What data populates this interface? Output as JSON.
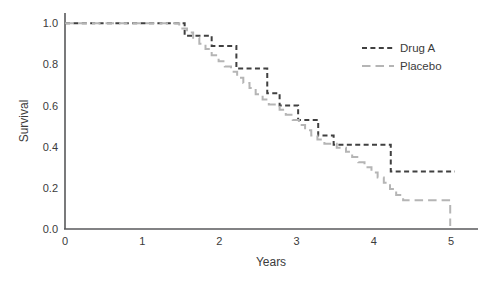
{
  "chart_data": {
    "type": "line",
    "subtype": "kaplan-meier-step",
    "title": "",
    "xlabel": "Years",
    "ylabel": "Survival",
    "xlim": [
      0,
      5.35
    ],
    "ylim": [
      0,
      1.05
    ],
    "xticks": [
      0,
      1,
      2,
      3,
      4,
      5
    ],
    "xtick_labels": [
      "0",
      "1",
      "2",
      "3",
      "4",
      "5"
    ],
    "yticks": [
      0.0,
      0.2,
      0.4,
      0.6,
      0.8,
      1.0
    ],
    "ytick_labels": [
      "0.0",
      "0.2",
      "0.4",
      "0.6",
      "0.8",
      "1.0"
    ],
    "grid": false,
    "legend_position": "upper right",
    "series": [
      {
        "name": "Drug A",
        "color": "#404040",
        "dash": "short-dash",
        "points": [
          [
            0.0,
            1.0
          ],
          [
            1.55,
            1.0
          ],
          [
            1.55,
            0.94
          ],
          [
            1.9,
            0.94
          ],
          [
            1.9,
            0.89
          ],
          [
            2.22,
            0.89
          ],
          [
            2.22,
            0.78
          ],
          [
            2.62,
            0.78
          ],
          [
            2.62,
            0.66
          ],
          [
            2.78,
            0.66
          ],
          [
            2.78,
            0.6
          ],
          [
            3.02,
            0.6
          ],
          [
            3.02,
            0.53
          ],
          [
            3.28,
            0.53
          ],
          [
            3.28,
            0.455
          ],
          [
            3.48,
            0.455
          ],
          [
            3.48,
            0.41
          ],
          [
            4.22,
            0.41
          ],
          [
            4.22,
            0.28
          ],
          [
            5.05,
            0.28
          ]
        ]
      },
      {
        "name": "Placebo",
        "color": "#b5b5b5",
        "dash": "long-dash",
        "points": [
          [
            0.0,
            1.0
          ],
          [
            1.48,
            1.0
          ],
          [
            1.48,
            0.975
          ],
          [
            1.58,
            0.975
          ],
          [
            1.58,
            0.955
          ],
          [
            1.66,
            0.955
          ],
          [
            1.66,
            0.93
          ],
          [
            1.74,
            0.93
          ],
          [
            1.74,
            0.9
          ],
          [
            1.82,
            0.9
          ],
          [
            1.82,
            0.875
          ],
          [
            1.9,
            0.875
          ],
          [
            1.9,
            0.845
          ],
          [
            1.99,
            0.845
          ],
          [
            1.99,
            0.815
          ],
          [
            2.07,
            0.815
          ],
          [
            2.07,
            0.79
          ],
          [
            2.15,
            0.79
          ],
          [
            2.15,
            0.765
          ],
          [
            2.23,
            0.765
          ],
          [
            2.23,
            0.735
          ],
          [
            2.31,
            0.735
          ],
          [
            2.31,
            0.71
          ],
          [
            2.39,
            0.71
          ],
          [
            2.39,
            0.685
          ],
          [
            2.47,
            0.685
          ],
          [
            2.47,
            0.655
          ],
          [
            2.56,
            0.655
          ],
          [
            2.56,
            0.63
          ],
          [
            2.64,
            0.63
          ],
          [
            2.64,
            0.605
          ],
          [
            2.78,
            0.605
          ],
          [
            2.78,
            0.58
          ],
          [
            2.86,
            0.58
          ],
          [
            2.86,
            0.555
          ],
          [
            2.95,
            0.555
          ],
          [
            2.95,
            0.53
          ],
          [
            3.03,
            0.53
          ],
          [
            3.03,
            0.505
          ],
          [
            3.11,
            0.505
          ],
          [
            3.11,
            0.48
          ],
          [
            3.19,
            0.48
          ],
          [
            3.19,
            0.455
          ],
          [
            3.27,
            0.455
          ],
          [
            3.27,
            0.435
          ],
          [
            3.36,
            0.435
          ],
          [
            3.36,
            0.415
          ],
          [
            3.52,
            0.415
          ],
          [
            3.52,
            0.395
          ],
          [
            3.64,
            0.395
          ],
          [
            3.64,
            0.375
          ],
          [
            3.72,
            0.375
          ],
          [
            3.72,
            0.35
          ],
          [
            3.8,
            0.35
          ],
          [
            3.8,
            0.325
          ],
          [
            3.88,
            0.325
          ],
          [
            3.88,
            0.3
          ],
          [
            3.97,
            0.3
          ],
          [
            3.97,
            0.275
          ],
          [
            4.05,
            0.275
          ],
          [
            4.05,
            0.25
          ],
          [
            4.13,
            0.25
          ],
          [
            4.13,
            0.225
          ],
          [
            4.21,
            0.225
          ],
          [
            4.21,
            0.195
          ],
          [
            4.29,
            0.195
          ],
          [
            4.29,
            0.165
          ],
          [
            4.38,
            0.165
          ],
          [
            4.38,
            0.14
          ],
          [
            4.99,
            0.14
          ],
          [
            4.99,
            0.015
          ]
        ]
      }
    ],
    "legend": [
      {
        "label": "Drug A",
        "color": "#404040",
        "dash": "short-dash"
      },
      {
        "label": "Placebo",
        "color": "#b5b5b5",
        "dash": "long-dash"
      }
    ]
  },
  "axis": {
    "x_title": "Years",
    "y_title": "Survival"
  },
  "colors": {
    "drug_a": "#404040",
    "placebo": "#b5b5b5",
    "axis": "#58595b",
    "text": "#3b3b3b",
    "background": "#ffffff"
  }
}
